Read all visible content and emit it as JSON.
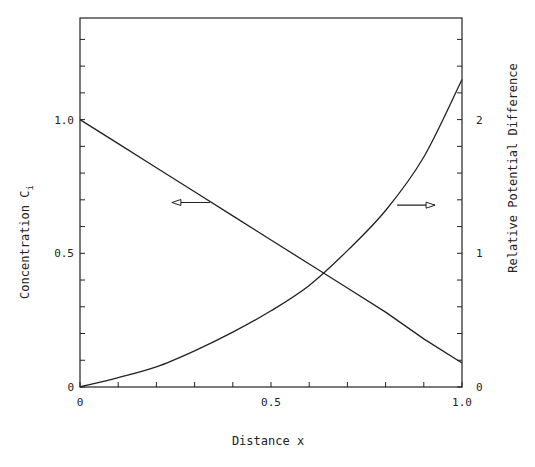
{
  "chart_data": {
    "type": "line",
    "title": "",
    "xlabel": "Distance x",
    "ylabel_left": "Concentration C",
    "ylabel_left_subscript": "i",
    "ylabel_right": "Relative Potential Difference",
    "xlim": [
      0,
      1.0
    ],
    "ylim_left": [
      0,
      1.38
    ],
    "ylim_right": [
      0,
      2.76
    ],
    "grid": false,
    "legend": "none",
    "x_ticks": [
      {
        "value": 0,
        "label": "0"
      },
      {
        "value": 0.1,
        "label": ""
      },
      {
        "value": 0.2,
        "label": ""
      },
      {
        "value": 0.3,
        "label": ""
      },
      {
        "value": 0.4,
        "label": ""
      },
      {
        "value": 0.5,
        "label": "0.5"
      },
      {
        "value": 0.6,
        "label": ""
      },
      {
        "value": 0.7,
        "label": ""
      },
      {
        "value": 0.8,
        "label": ""
      },
      {
        "value": 0.9,
        "label": ""
      },
      {
        "value": 1.0,
        "label": "1.0"
      }
    ],
    "y_left_ticks": [
      {
        "value": 0,
        "label": "0"
      },
      {
        "value": 0.1,
        "label": ""
      },
      {
        "value": 0.2,
        "label": ""
      },
      {
        "value": 0.3,
        "label": ""
      },
      {
        "value": 0.4,
        "label": ""
      },
      {
        "value": 0.5,
        "label": "0.5"
      },
      {
        "value": 0.6,
        "label": ""
      },
      {
        "value": 0.7,
        "label": ""
      },
      {
        "value": 0.8,
        "label": ""
      },
      {
        "value": 0.9,
        "label": ""
      },
      {
        "value": 1.0,
        "label": "1.0"
      },
      {
        "value": 1.1,
        "label": ""
      },
      {
        "value": 1.2,
        "label": ""
      },
      {
        "value": 1.3,
        "label": ""
      }
    ],
    "y_right_ticks": [
      {
        "value": 0,
        "label": "0"
      },
      {
        "value": 0.2,
        "label": ""
      },
      {
        "value": 0.4,
        "label": ""
      },
      {
        "value": 0.6,
        "label": ""
      },
      {
        "value": 0.8,
        "label": ""
      },
      {
        "value": 1,
        "label": "1"
      },
      {
        "value": 1.2,
        "label": ""
      },
      {
        "value": 1.4,
        "label": ""
      },
      {
        "value": 1.6,
        "label": ""
      },
      {
        "value": 1.8,
        "label": ""
      },
      {
        "value": 2,
        "label": "2"
      },
      {
        "value": 2.2,
        "label": ""
      },
      {
        "value": 2.4,
        "label": ""
      },
      {
        "value": 2.6,
        "label": ""
      }
    ],
    "series": [
      {
        "name": "Concentration C_i",
        "axis": "left",
        "x": [
          0,
          0.1,
          0.2,
          0.3,
          0.4,
          0.5,
          0.6,
          0.7,
          0.8,
          0.9,
          1.0
        ],
        "values": [
          1.0,
          0.91,
          0.82,
          0.73,
          0.64,
          0.55,
          0.46,
          0.37,
          0.28,
          0.18,
          0.09
        ]
      },
      {
        "name": "Relative Potential Difference",
        "axis": "right",
        "x": [
          0,
          0.1,
          0.2,
          0.3,
          0.4,
          0.5,
          0.6,
          0.7,
          0.8,
          0.9,
          1.0
        ],
        "values": [
          0,
          0.07,
          0.15,
          0.27,
          0.41,
          0.57,
          0.76,
          1.02,
          1.32,
          1.72,
          2.3
        ]
      }
    ],
    "annotations": [
      {
        "type": "arrow",
        "direction": "left",
        "points_to_axis": "left",
        "from_series": "Concentration C_i",
        "at_x": 0.34,
        "at_value": 0.69
      },
      {
        "type": "arrow",
        "direction": "right",
        "points_to_axis": "right",
        "from_series": "Relative Potential Difference",
        "at_x": 0.83,
        "at_value": 1.36
      }
    ],
    "colors": {
      "line": "#222222",
      "background": "#ffffff"
    }
  }
}
